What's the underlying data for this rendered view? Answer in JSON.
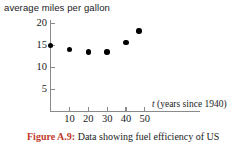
{
  "chart_data": {
    "type": "scatter",
    "title": "average miles per gallon",
    "xlabel": "t (years since 1940)",
    "xlabel_var": "t",
    "xlabel_rest": " (years since 1940)",
    "ylabel": "",
    "x": [
      0,
      10,
      20,
      30,
      40,
      47
    ],
    "values": [
      15.0,
      14.0,
      13.5,
      13.5,
      15.7,
      18.3
    ],
    "points": [
      {
        "x": 0,
        "y": 15.0
      },
      {
        "x": 10,
        "y": 14.0
      },
      {
        "x": 20,
        "y": 13.5
      },
      {
        "x": 30,
        "y": 13.5
      },
      {
        "x": 40,
        "y": 15.7
      },
      {
        "x": 47,
        "y": 18.3
      }
    ],
    "xticks": [
      10,
      20,
      30,
      40,
      50
    ],
    "yticks": [
      20,
      15,
      10,
      5
    ],
    "xlim": [
      0,
      56
    ],
    "ylim": [
      0,
      21.5
    ],
    "grid": false,
    "legend": null,
    "marker_color": "#000000",
    "axis_color": "#8a8a8a"
  },
  "caption": {
    "label": "Figure A.9:",
    "text": " Data showing fuel efficiency of US"
  }
}
